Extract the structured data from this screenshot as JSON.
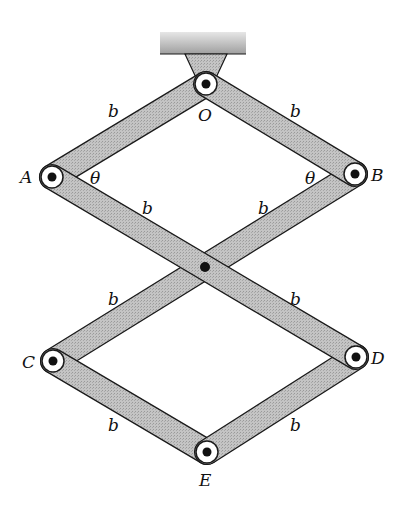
{
  "diagram": {
    "type": "linkage",
    "colors": {
      "bar_fill": "#bdbdbd",
      "bar_stroke": "#1a1a1a",
      "support_fill": "#b5b5b5",
      "pin_ring": "#ffffff",
      "pin_dot": "#111111",
      "label": "#111111"
    },
    "nodes": [
      {
        "id": "O",
        "label": "O",
        "x": 206,
        "y": 84
      },
      {
        "id": "A",
        "label": "A",
        "x": 52,
        "y": 177
      },
      {
        "id": "B",
        "label": "B",
        "x": 355,
        "y": 174
      },
      {
        "id": "C",
        "label": "C",
        "x": 53,
        "y": 361
      },
      {
        "id": "D",
        "label": "D",
        "x": 356,
        "y": 357
      },
      {
        "id": "E",
        "label": "E",
        "x": 207,
        "y": 452
      },
      {
        "id": "M",
        "label": "",
        "x": 205,
        "y": 267
      }
    ],
    "members": [
      {
        "from": "O",
        "to": "A",
        "length_label": "b"
      },
      {
        "from": "O",
        "to": "B",
        "length_label": "b"
      },
      {
        "from": "A",
        "to": "D",
        "length_label": "b"
      },
      {
        "from": "B",
        "to": "C",
        "length_label": "b"
      },
      {
        "from": "C",
        "to": "E",
        "length_label": "b"
      },
      {
        "from": "D",
        "to": "E",
        "length_label": "b"
      }
    ],
    "labels": {
      "O": "O",
      "A": "A",
      "B": "B",
      "C": "C",
      "D": "D",
      "E": "E",
      "b": "b",
      "theta": "θ"
    },
    "angle_labels": [
      {
        "at": "A",
        "text": "θ"
      },
      {
        "at": "B",
        "text": "θ"
      }
    ],
    "support": "fixed ceiling bracket above O"
  }
}
